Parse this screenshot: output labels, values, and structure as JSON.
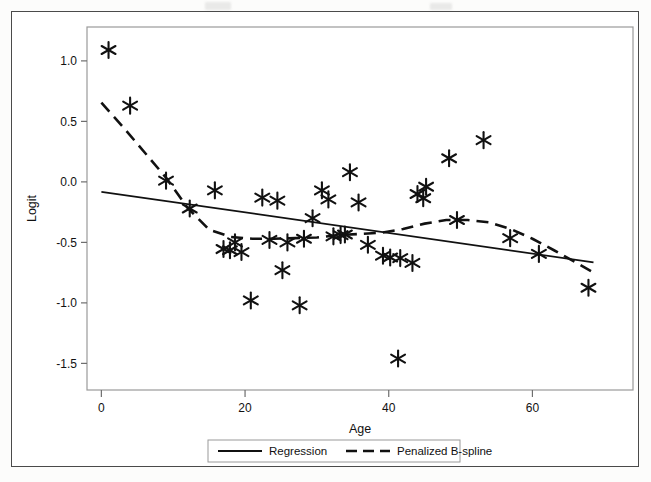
{
  "chart_data": {
    "type": "scatter",
    "title": "",
    "xlabel": "Age",
    "ylabel": "Logit",
    "xlim": [
      -2,
      74
    ],
    "ylim": [
      -1.72,
      1.28
    ],
    "xticks": [
      0,
      20,
      40,
      60
    ],
    "yticks": [
      1.0,
      0.5,
      0.0,
      -0.5,
      -1.0,
      -1.5
    ],
    "xtick_labels": [
      "0",
      "20",
      "40",
      "60"
    ],
    "ytick_labels": [
      "1.0",
      "0.5",
      "0.0",
      "-0.5",
      "-1.0",
      "-1.5"
    ],
    "grid": false,
    "legend_position": "below-axis",
    "marker": "asterisk",
    "points": [
      {
        "x": 1.0,
        "y": 1.09
      },
      {
        "x": 4.0,
        "y": 0.63
      },
      {
        "x": 9.0,
        "y": 0.01
      },
      {
        "x": 12.3,
        "y": -0.22
      },
      {
        "x": 15.8,
        "y": -0.07
      },
      {
        "x": 17.0,
        "y": -0.555
      },
      {
        "x": 17.9,
        "y": -0.565
      },
      {
        "x": 18.6,
        "y": -0.5
      },
      {
        "x": 19.5,
        "y": -0.58
      },
      {
        "x": 20.8,
        "y": -0.98
      },
      {
        "x": 22.4,
        "y": -0.13
      },
      {
        "x": 23.4,
        "y": -0.48
      },
      {
        "x": 24.5,
        "y": -0.155
      },
      {
        "x": 25.2,
        "y": -0.73
      },
      {
        "x": 25.9,
        "y": -0.5
      },
      {
        "x": 27.6,
        "y": -1.02
      },
      {
        "x": 28.2,
        "y": -0.47
      },
      {
        "x": 29.4,
        "y": -0.3
      },
      {
        "x": 30.7,
        "y": -0.07
      },
      {
        "x": 31.6,
        "y": -0.145
      },
      {
        "x": 32.3,
        "y": -0.45
      },
      {
        "x": 33.3,
        "y": -0.44
      },
      {
        "x": 33.9,
        "y": -0.435
      },
      {
        "x": 34.6,
        "y": 0.08
      },
      {
        "x": 35.8,
        "y": -0.17
      },
      {
        "x": 37.1,
        "y": -0.52
      },
      {
        "x": 39.2,
        "y": -0.61
      },
      {
        "x": 40.2,
        "y": -0.625
      },
      {
        "x": 41.3,
        "y": -1.46
      },
      {
        "x": 41.6,
        "y": -0.63
      },
      {
        "x": 43.3,
        "y": -0.67
      },
      {
        "x": 44.0,
        "y": -0.1
      },
      {
        "x": 44.8,
        "y": -0.135
      },
      {
        "x": 45.2,
        "y": -0.04
      },
      {
        "x": 48.4,
        "y": 0.195
      },
      {
        "x": 49.5,
        "y": -0.315
      },
      {
        "x": 53.2,
        "y": 0.345
      },
      {
        "x": 56.9,
        "y": -0.465
      },
      {
        "x": 60.9,
        "y": -0.595
      },
      {
        "x": 67.8,
        "y": -0.875
      }
    ],
    "series": [
      {
        "name": "Regression",
        "style": "solid",
        "points": [
          {
            "x": 0.0,
            "y": -0.082
          },
          {
            "x": 68.5,
            "y": -0.665
          }
        ]
      },
      {
        "name": "Penalized B-spline",
        "style": "dashed",
        "points": [
          {
            "x": 0.0,
            "y": 0.655
          },
          {
            "x": 3.0,
            "y": 0.455
          },
          {
            "x": 6.0,
            "y": 0.245
          },
          {
            "x": 9.0,
            "y": 0.035
          },
          {
            "x": 12.0,
            "y": -0.215
          },
          {
            "x": 15.0,
            "y": -0.395
          },
          {
            "x": 18.0,
            "y": -0.455
          },
          {
            "x": 21.0,
            "y": -0.47
          },
          {
            "x": 24.0,
            "y": -0.47
          },
          {
            "x": 27.0,
            "y": -0.465
          },
          {
            "x": 30.0,
            "y": -0.46
          },
          {
            "x": 33.0,
            "y": -0.44
          },
          {
            "x": 36.0,
            "y": -0.43
          },
          {
            "x": 39.0,
            "y": -0.42
          },
          {
            "x": 42.0,
            "y": -0.39
          },
          {
            "x": 45.0,
            "y": -0.345
          },
          {
            "x": 48.0,
            "y": -0.315
          },
          {
            "x": 51.0,
            "y": -0.315
          },
          {
            "x": 54.0,
            "y": -0.335
          },
          {
            "x": 57.0,
            "y": -0.39
          },
          {
            "x": 60.0,
            "y": -0.47
          },
          {
            "x": 63.0,
            "y": -0.565
          },
          {
            "x": 66.0,
            "y": -0.665
          },
          {
            "x": 69.0,
            "y": -0.765
          }
        ]
      }
    ],
    "legend": [
      {
        "label": "Regression",
        "style": "solid"
      },
      {
        "label": "Penalized B-spline",
        "style": "dashed"
      }
    ],
    "colors": {
      "line": "#111111",
      "marker": "#111111",
      "axis": "#6e6e6e",
      "frame": "#4a4a4a",
      "background": "#ffffff"
    }
  }
}
